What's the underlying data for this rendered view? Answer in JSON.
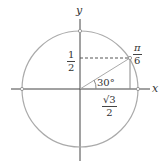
{
  "diagram": {
    "axes": {
      "x_label": "x",
      "y_label": "y"
    },
    "angle_label": "30°",
    "point_label": {
      "num": "π",
      "den": "6"
    },
    "y_coord_label": {
      "num": "1",
      "den": "2"
    },
    "x_coord_label": {
      "num": "√3",
      "den": "2"
    },
    "colors": {
      "circle": "#aaaaaa",
      "axes": "#444444",
      "text": "#333333"
    }
  }
}
